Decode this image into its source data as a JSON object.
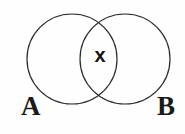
{
  "figure": {
    "kind": "venn-diagram",
    "background_color": "#fefefe",
    "stroke_color": "#2b2b2b",
    "stroke_width": 1.2,
    "width": 185,
    "height": 134
  },
  "circles": [
    {
      "id": "set-a",
      "label": "A",
      "center_x": 72,
      "center_y": 59,
      "radius": 45
    },
    {
      "id": "set-b",
      "label": "B",
      "center_x": 125,
      "center_y": 59,
      "radius": 45
    }
  ],
  "labels": {
    "set_a": "A",
    "set_b": "B",
    "intersection_marker": "x"
  },
  "intersection": {
    "marker_text": "x",
    "marker_x": 100,
    "marker_y": 57,
    "marker_color": "#141414",
    "crossing_top_x": 100,
    "crossing_top_y": 20,
    "crossing_bottom_x": 100,
    "crossing_bottom_y": 100
  }
}
